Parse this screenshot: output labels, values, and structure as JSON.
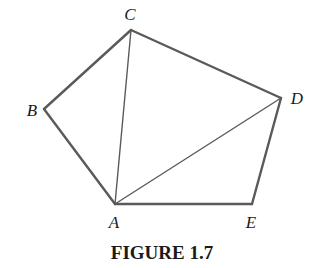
{
  "figure": {
    "caption": "FIGURE 1.7",
    "type": "pentagon with triangulation diagonals from vertex A",
    "colors": {
      "background": "#ffffff",
      "edge": "#5a5a5a",
      "text": "#1a1a1a"
    },
    "vertices": {
      "A": {
        "label": "A",
        "x": 115,
        "y": 204,
        "label_x": 114,
        "label_y": 228
      },
      "B": {
        "label": "B",
        "x": 44,
        "y": 109,
        "label_x": 32,
        "label_y": 116
      },
      "C": {
        "label": "C",
        "x": 131,
        "y": 30,
        "label_x": 130,
        "label_y": 20
      },
      "D": {
        "label": "D",
        "x": 281,
        "y": 98,
        "label_x": 297,
        "label_y": 104
      },
      "E": {
        "label": "E",
        "x": 252,
        "y": 204,
        "label_x": 251,
        "label_y": 228
      }
    },
    "edges": [
      {
        "from": "A",
        "to": "B",
        "kind": "side"
      },
      {
        "from": "B",
        "to": "C",
        "kind": "side"
      },
      {
        "from": "C",
        "to": "D",
        "kind": "side"
      },
      {
        "from": "D",
        "to": "E",
        "kind": "side"
      },
      {
        "from": "E",
        "to": "A",
        "kind": "side"
      },
      {
        "from": "A",
        "to": "C",
        "kind": "diagonal"
      },
      {
        "from": "A",
        "to": "D",
        "kind": "diagonal"
      }
    ]
  }
}
